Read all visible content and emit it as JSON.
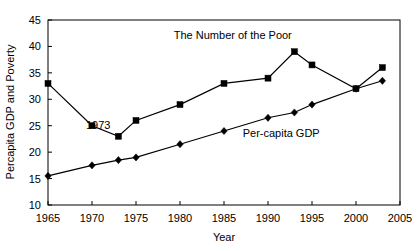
{
  "chart_data": {
    "type": "line",
    "title": "",
    "xlabel": "Year",
    "ylabel": "Percapita GDP and Poverty",
    "xlim": [
      1965,
      2005
    ],
    "ylim": [
      10,
      45
    ],
    "xticks": [
      "1965",
      "1970",
      "1975",
      "1980",
      "1985",
      "1990",
      "1995",
      "2000",
      "2005"
    ],
    "yticks": [
      "10",
      "15",
      "20",
      "25",
      "30",
      "35",
      "40",
      "45"
    ],
    "grid": false,
    "legend_position": "inline-annotations",
    "x": [
      1965,
      1970,
      1973,
      1975,
      1980,
      1985,
      1990,
      1993,
      1995,
      2000,
      2003
    ],
    "series": [
      {
        "name": "The Number of the Poor",
        "marker": "square",
        "values": [
          33,
          25,
          23,
          26,
          29,
          33,
          34,
          39,
          36.5,
          32,
          36
        ]
      },
      {
        "name": "Per-capita GDP",
        "marker": "diamond",
        "values": [
          15.5,
          17.5,
          18.5,
          19,
          21.5,
          24,
          26.5,
          27.5,
          29,
          32,
          33.5
        ]
      }
    ],
    "annotations": [
      {
        "text": "1973",
        "x": 1973,
        "y": 24.3
      }
    ],
    "series_labels": [
      {
        "text": "The Number of the Poor",
        "x": 1986,
        "y": 41.5
      },
      {
        "text": "Per-capita GDP",
        "x": 1991.5,
        "y": 22.8
      }
    ],
    "colors": {
      "line": "#000000",
      "marker": "#000000",
      "axis": "#000000",
      "background": "#ffffff"
    }
  }
}
